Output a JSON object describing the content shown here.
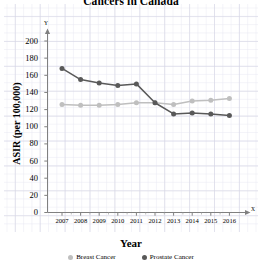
{
  "chart_data": {
    "type": "line",
    "title": "Cancers in Canada",
    "xlabel": "Year",
    "ylabel": "ASIR (per 100,000)",
    "categories": [
      2007,
      2008,
      2009,
      2010,
      2011,
      2012,
      2013,
      2014,
      2015,
      2016
    ],
    "x_tick_labels": [
      "2007",
      "2008",
      "2009",
      "2010",
      "2011",
      "2012",
      "2013",
      "2014",
      "2015",
      "2016"
    ],
    "y_tick_labels": [
      "0",
      "20",
      "40",
      "60",
      "80",
      "100",
      "120",
      "140",
      "160",
      "180",
      "200"
    ],
    "y_ticks": [
      0,
      20,
      40,
      60,
      80,
      100,
      120,
      140,
      160,
      180,
      200
    ],
    "ylim": [
      0,
      200
    ],
    "xlim": [
      2006.4,
      2016.8
    ],
    "grid": true,
    "legend_position": "bottom",
    "axis_marker_x": "X",
    "axis_marker_y": "Y",
    "series": [
      {
        "name": "Breast Cancer",
        "color": "#bfbfbf",
        "marker": "circle",
        "values": [
          126,
          125,
          125,
          126,
          128,
          128,
          126,
          130,
          131,
          133
        ]
      },
      {
        "name": "Prostate Cancer",
        "color": "#595959",
        "marker": "circle",
        "values": [
          168,
          155,
          151,
          148,
          150,
          128,
          115,
          116,
          115,
          113
        ]
      }
    ]
  },
  "legend": {
    "items": [
      {
        "label": "Breast Cancer",
        "color": "#bfbfbf"
      },
      {
        "label": "Prostate Cancer",
        "color": "#595959"
      }
    ]
  }
}
